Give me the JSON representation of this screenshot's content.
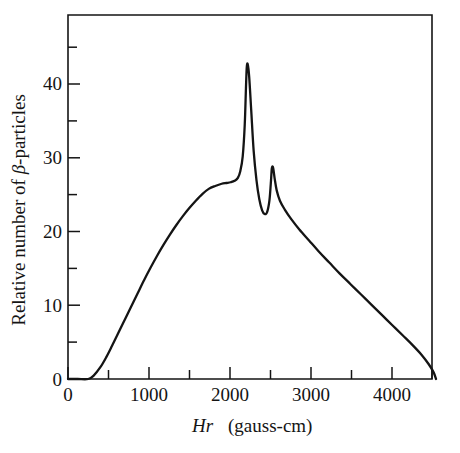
{
  "figure": {
    "background": "#ffffff",
    "line_color": "#141414",
    "axis_color": "#141414"
  },
  "chart_data": {
    "type": "line",
    "title": "",
    "subtitle": "",
    "xlabel_italic": "Hr",
    "xlabel_rest": "(gauss-cm)",
    "xlabel": "Hr (gauss-cm)",
    "ylabel": "Relative number of β-particles",
    "ylabel_prefix": "Relative number of ",
    "ylabel_symbol": "β",
    "ylabel_suffix": "-particles",
    "xlim": [
      0,
      4500
    ],
    "ylim": [
      0,
      49.4
    ],
    "grid": false,
    "legend": "none",
    "x_major_ticks": [
      0,
      1000,
      2000,
      3000,
      4000
    ],
    "x_major_tick_labels": [
      "0",
      "1000",
      "2000",
      "3000",
      "4000"
    ],
    "x_minor_ticks": [
      500,
      1500,
      2500,
      3500,
      4500
    ],
    "y_major_ticks": [
      0,
      10,
      20,
      30,
      40
    ],
    "y_major_tick_labels": [
      "0",
      "10",
      "20",
      "30",
      "40"
    ],
    "y_minor_ticks": [
      5,
      15,
      25,
      35,
      45
    ],
    "annotations": [
      {
        "name": "continuous-beta-spectrum-plateau",
        "x": 1800,
        "y": 26.6
      },
      {
        "name": "conversion-line-peak-main",
        "x": 2210,
        "y": 42.7
      },
      {
        "name": "conversion-line-valley",
        "x": 2400,
        "y": 22.4
      },
      {
        "name": "conversion-line-peak-secondary",
        "x": 2520,
        "y": 28.7
      },
      {
        "name": "spectrum-onset",
        "x": 250,
        "y": 0.0
      },
      {
        "name": "spectrum-endpoint",
        "x": 4550,
        "y": 0.0
      }
    ],
    "x": [
      0,
      120,
      250,
      320,
      400,
      470,
      540,
      620,
      700,
      780,
      860,
      940,
      1020,
      1100,
      1180,
      1260,
      1340,
      1420,
      1500,
      1580,
      1660,
      1740,
      1820,
      1900,
      1960,
      2010,
      2060,
      2100,
      2130,
      2160,
      2185,
      2200,
      2210,
      2222,
      2240,
      2265,
      2295,
      2330,
      2365,
      2400,
      2430,
      2460,
      2490,
      2510,
      2520,
      2535,
      2555,
      2580,
      2620,
      2680,
      2760,
      2860,
      2980,
      3100,
      3230,
      3360,
      3490,
      3620,
      3750,
      3880,
      4010,
      4140,
      4260,
      4370,
      4460,
      4520,
      4550
    ],
    "y": [
      0,
      0,
      0,
      0.5,
      1.6,
      2.9,
      4.4,
      6.2,
      8.0,
      9.8,
      11.6,
      13.4,
      15.1,
      16.7,
      18.2,
      19.6,
      20.9,
      22.1,
      23.2,
      24.2,
      25.1,
      25.8,
      26.2,
      26.5,
      26.6,
      26.7,
      26.9,
      27.3,
      28.2,
      30.2,
      34.5,
      39.5,
      42.3,
      42.7,
      41.0,
      36.5,
      31.0,
      27.0,
      24.4,
      22.9,
      22.4,
      22.6,
      24.2,
      27.0,
      28.6,
      28.7,
      27.2,
      25.6,
      24.2,
      23.0,
      21.7,
      20.3,
      18.8,
      17.3,
      15.8,
      14.3,
      12.9,
      11.5,
      10.1,
      8.7,
      7.3,
      5.9,
      4.6,
      3.3,
      2.0,
      0.9,
      0.0
    ]
  }
}
